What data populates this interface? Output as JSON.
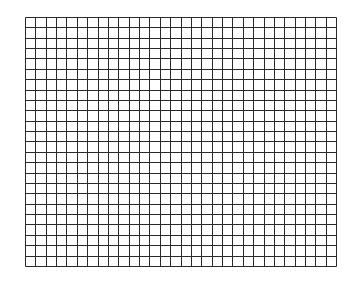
{
  "grid": {
    "columns": 30,
    "rows": 24,
    "cell_size": 10.37,
    "left": 25,
    "top": 17,
    "line_color": "#2a2a2a",
    "background_color": "#ffffff"
  }
}
